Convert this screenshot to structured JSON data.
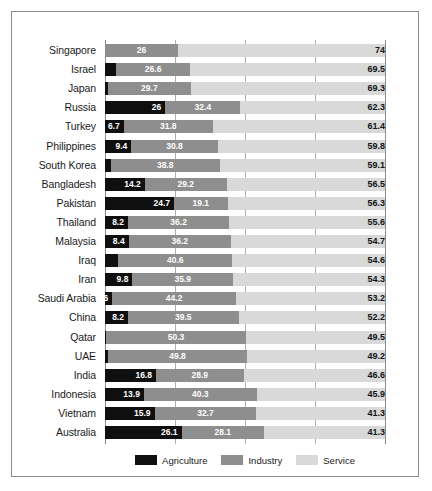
{
  "chart_data": {
    "type": "bar",
    "title": "",
    "subtitle": "",
    "xlabel": "",
    "ylabel": "",
    "orientation": "horizontal",
    "stacked": true,
    "stack_mode": "percent",
    "xlim": [
      0,
      100
    ],
    "gridlines": [
      25,
      50,
      75
    ],
    "grid": true,
    "legend_position": "bottom-center",
    "categories": [
      "Singapore",
      "Israel",
      "Japan",
      "Russia",
      "Turkey",
      "Philippines",
      "South Korea",
      "Bangladesh",
      "Pakistan",
      "Thailand",
      "Malaysia",
      "Iraq",
      "Iran",
      "Saudi Arabia",
      "China",
      "Qatar",
      "UAE",
      "India",
      "Indonesia",
      "Vietnam",
      "Australia"
    ],
    "series": [
      {
        "name": "Agriculture",
        "color": "#0f0f0f",
        "values": [
          0,
          3.9,
          1,
          26,
          6.7,
          9.4,
          2.1,
          14.2,
          24.7,
          8.2,
          8.4,
          4.8,
          9.8,
          2.6,
          8.2,
          0.2,
          1,
          16.8,
          13.9,
          15.9,
          26.1
        ]
      },
      {
        "name": "Industry",
        "color": "#8e8e8e",
        "values": [
          26,
          26.6,
          29.7,
          32.4,
          31.8,
          30.8,
          38.8,
          29.2,
          19.1,
          36.2,
          36.2,
          40.6,
          35.9,
          44.2,
          39.5,
          50.3,
          49.8,
          28.9,
          40.3,
          32.7,
          28.1
        ]
      },
      {
        "name": "Service",
        "color": "#d9d9d9",
        "values": [
          74,
          69.5,
          69.3,
          62.3,
          61.4,
          59.8,
          59.1,
          56.5,
          56.3,
          55.6,
          54.7,
          54.6,
          54.3,
          53.2,
          52.2,
          49.5,
          49.2,
          46.6,
          45.9,
          41.3,
          41.3
        ]
      }
    ],
    "visible_labels": {
      "agriculture": [
        "",
        "",
        "",
        "26",
        "6.7",
        "9.4",
        "",
        "14.2",
        "24.7",
        "8.2",
        "8.4",
        "",
        "9.8",
        "26",
        "8.2",
        "",
        "",
        "16.8",
        "13.9",
        "15.9",
        "26.1"
      ],
      "industry": [
        "26",
        "26.6",
        "29.7",
        "32.4",
        "31.8",
        "30.8",
        "38.8",
        "29.2",
        "19.1",
        "36.2",
        "36.2",
        "40.6",
        "35.9",
        "44.2",
        "39.5",
        "50.3",
        "49.8",
        "28.9",
        "40.3",
        "32.7",
        "28.1"
      ],
      "service": [
        "74",
        "69.5",
        "69.3",
        "62.3",
        "61.4",
        "59.8",
        "59.1",
        "56.5",
        "56.3",
        "55.6",
        "54.7",
        "54.6",
        "54.3",
        "53.2",
        "52.2",
        "49.5",
        "49.2",
        "46.6",
        "45.9",
        "41.3",
        "41.3"
      ]
    }
  },
  "legend": {
    "items": [
      {
        "label": "Agriculture",
        "color": "#0f0f0f"
      },
      {
        "label": "Industry",
        "color": "#8e8e8e"
      },
      {
        "label": "Service",
        "color": "#d9d9d9"
      }
    ]
  }
}
